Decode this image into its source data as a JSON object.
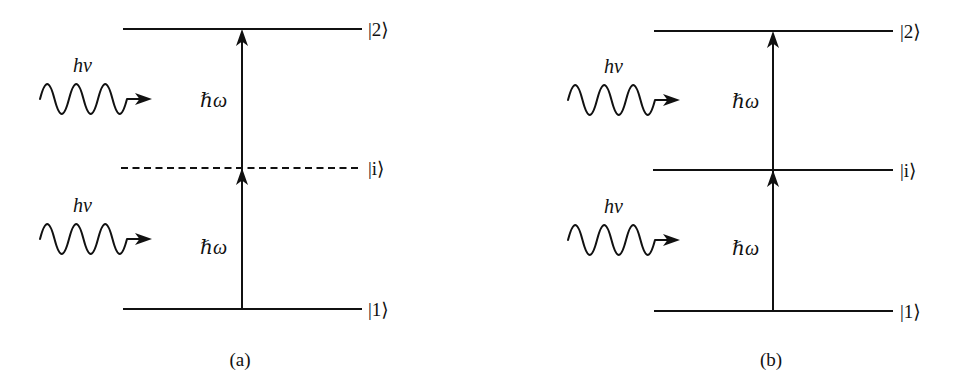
{
  "diagram": {
    "colors": {
      "line": "#111111",
      "background": "#ffffff"
    },
    "panels": [
      {
        "caption": "(a)",
        "levels": [
          {
            "label": "|2⟩",
            "style": "solid"
          },
          {
            "label": "|i⟩",
            "style": "dashed"
          },
          {
            "label": "|1⟩",
            "style": "solid"
          }
        ],
        "photons": [
          {
            "label": "hν"
          },
          {
            "label": "hν"
          }
        ],
        "transitions": [
          {
            "label": "ℏω",
            "from": "|i⟩",
            "to": "|2⟩"
          },
          {
            "label": "ℏω",
            "from": "|1⟩",
            "to": "|i⟩"
          }
        ]
      },
      {
        "caption": "(b)",
        "levels": [
          {
            "label": "|2⟩",
            "style": "solid"
          },
          {
            "label": "|i⟩",
            "style": "solid"
          },
          {
            "label": "|1⟩",
            "style": "solid"
          }
        ],
        "photons": [
          {
            "label": "hν"
          },
          {
            "label": "hν"
          }
        ],
        "transitions": [
          {
            "label": "ℏω",
            "from": "|i⟩",
            "to": "|2⟩"
          },
          {
            "label": "ℏω",
            "from": "|1⟩",
            "to": "|i⟩"
          }
        ]
      }
    ]
  }
}
